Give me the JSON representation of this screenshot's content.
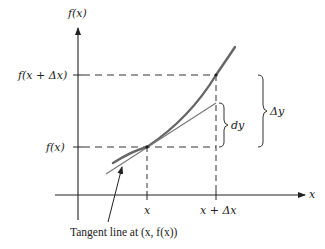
{
  "diagram": {
    "labels": {
      "y_axis": "f(x)",
      "x_axis": "x",
      "f_x_plus_dx": "f(x + Δx)",
      "f_x": "f(x)",
      "tick_x": "x",
      "tick_x_plus_dx": "x + Δx",
      "dy": "dy",
      "delta_y": "Δy",
      "caption": "Tangent line at (x, f(x))"
    },
    "colors": {
      "axis": "#222222",
      "curve": "#666666",
      "tangent": "#777777",
      "dashed": "#333333",
      "text": "#222222",
      "background": "#ffffff"
    }
  }
}
